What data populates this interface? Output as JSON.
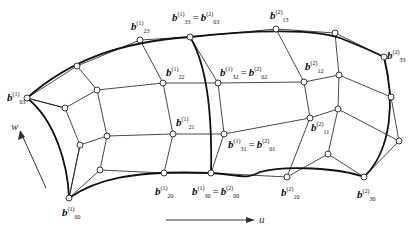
{
  "figure": {
    "axes": {
      "u_label": "u",
      "w_label": "w"
    },
    "labels": [
      {
        "id": "b23_1",
        "base": "b",
        "sup": "(1)",
        "sub": "23"
      },
      {
        "id": "b33_1_eq_b03_2",
        "base": "b",
        "sup": "(1)",
        "sub": "33",
        "eq": "=",
        "base2": "b",
        "sup2": "(2)",
        "sub2": "03"
      },
      {
        "id": "b13_2",
        "base": "b",
        "sup": "(2)",
        "sub": "13"
      },
      {
        "id": "b33_2",
        "base": "b",
        "sup": "(2)",
        "sub": "33"
      },
      {
        "id": "b22_1",
        "base": "b",
        "sup": "(1)",
        "sub": "22"
      },
      {
        "id": "b32_1_eq_b02_2",
        "base": "b",
        "sup": "(1)",
        "sub": "32",
        "eq": "=",
        "base2": "b",
        "sup2": "(2)",
        "sub2": "02"
      },
      {
        "id": "b12_2",
        "base": "b",
        "sup": "(2)",
        "sub": "12"
      },
      {
        "id": "b03_1",
        "base": "b",
        "sup": "(1)",
        "sub": "03"
      },
      {
        "id": "b21_1",
        "base": "b",
        "sup": "(1)",
        "sub": "21"
      },
      {
        "id": "b31_1_eq_b01_2",
        "base": "b",
        "sup": "(1)",
        "sub": "31",
        "eq": "=",
        "base2": "b",
        "sup2": "(2)",
        "sub2": "01"
      },
      {
        "id": "b11_2",
        "base": "b",
        "sup": "(2)",
        "sub": "11"
      },
      {
        "id": "b20_1",
        "base": "b",
        "sup": "(1)",
        "sub": "20"
      },
      {
        "id": "b30_1_eq_b00_2",
        "base": "b",
        "sup": "(1)",
        "sub": "30",
        "eq": "=",
        "base2": "b",
        "sup2": "(2)",
        "sub2": "00"
      },
      {
        "id": "b10_2",
        "base": "b",
        "sup": "(2)",
        "sub": "10"
      },
      {
        "id": "b30_2",
        "base": "b",
        "sup": "(2)",
        "sub": "30"
      },
      {
        "id": "b00_1",
        "base": "b",
        "sup": "(1)",
        "sub": "00"
      }
    ]
  }
}
